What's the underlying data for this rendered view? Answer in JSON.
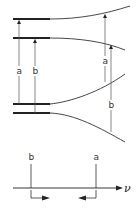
{
  "diagram": {
    "title": "",
    "colors": {
      "line": "#222222",
      "thin": "#555555",
      "background": "#ffffff"
    },
    "energy_levels": [
      {
        "id": "upper-1",
        "left_y": 19,
        "right_y": 6
      },
      {
        "id": "upper-2",
        "left_y": 38,
        "right_y": 50
      },
      {
        "id": "lower-1",
        "left_y": 104,
        "right_y": 74
      },
      {
        "id": "lower-2",
        "left_y": 113,
        "right_y": 142
      }
    ],
    "left_transitions": [
      {
        "label": "a",
        "x": 19
      },
      {
        "label": "b",
        "x": 35
      }
    ],
    "right_transitions": [
      {
        "label": "a",
        "x": 105
      },
      {
        "label": "b",
        "x": 111
      }
    ],
    "spectrum": {
      "axis_label": "ν",
      "lines": [
        {
          "label": "b",
          "x": 31
        },
        {
          "label": "a",
          "x": 96
        }
      ]
    }
  }
}
